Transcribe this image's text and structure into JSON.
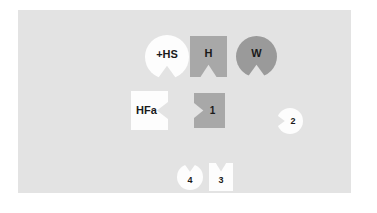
{
  "canvas": {
    "width": 377,
    "height": 213,
    "background": "#ffffff"
  },
  "panel": {
    "name": "diagram-panel",
    "background": "#e3e3e3",
    "x": 18,
    "y": 10,
    "width": 333,
    "height": 183
  },
  "colors": {
    "panel_background": "#e3e3e3",
    "white_piece": "#fdfdfd",
    "medium_gray_piece": "#a8a8a8",
    "dark_gray_piece": "#9a9a9a",
    "label_text": "#1a1a1a"
  },
  "shapes": [
    {
      "id": "hs",
      "label": "+HS",
      "form": "circle",
      "fill": "#fdfdfd",
      "notch_side": "bottom",
      "x": 145,
      "y": 35,
      "width": 44,
      "height": 44,
      "font_size": 11
    },
    {
      "id": "h",
      "label": "H",
      "form": "square",
      "fill": "#a8a8a8",
      "notch_side": "bottom",
      "x": 190,
      "y": 36,
      "width": 37,
      "height": 41,
      "font_size": 11
    },
    {
      "id": "w",
      "label": "W",
      "form": "circle",
      "fill": "#9a9a9a",
      "notch_side": "bottom",
      "x": 236,
      "y": 36,
      "width": 41,
      "height": 41,
      "font_size": 11
    },
    {
      "id": "hfa",
      "label": "HFa",
      "form": "square",
      "fill": "#fdfdfd",
      "notch_side": "right",
      "x": 131,
      "y": 91,
      "width": 37,
      "height": 39,
      "font_size": 11
    },
    {
      "id": "piece-1",
      "label": "1",
      "form": "square",
      "fill": "#a8a8a8",
      "notch_side": "left",
      "x": 194,
      "y": 93,
      "width": 31,
      "height": 35,
      "font_size": 10
    },
    {
      "id": "piece-2",
      "label": "2",
      "form": "circle",
      "fill": "#fdfdfd",
      "notch_side": "left",
      "x": 277,
      "y": 108,
      "width": 26,
      "height": 26,
      "font_size": 9
    },
    {
      "id": "piece-4",
      "label": "4",
      "form": "circle",
      "fill": "#fdfdfd",
      "notch_side": "top",
      "x": 177,
      "y": 164,
      "width": 26,
      "height": 26,
      "font_size": 9
    },
    {
      "id": "piece-3",
      "label": "3",
      "form": "square",
      "fill": "#fdfdfd",
      "notch_side": "top",
      "x": 209,
      "y": 163,
      "width": 24,
      "height": 28,
      "font_size": 9
    }
  ]
}
